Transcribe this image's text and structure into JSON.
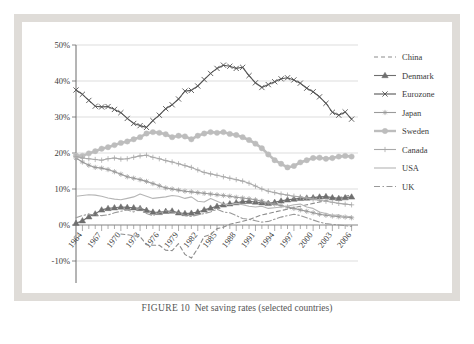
{
  "caption": {
    "label": "FIGURE",
    "number": "10",
    "text": "Net saving rates (selected countries)"
  },
  "chart_data": {
    "type": "line",
    "title": "",
    "xlabel": "",
    "ylabel": "",
    "ylim": [
      -10,
      50
    ],
    "yticks": [
      -10,
      0,
      10,
      20,
      30,
      40,
      50
    ],
    "ytick_labels": [
      "-10%",
      "0%",
      "10%",
      "20%",
      "30%",
      "40%",
      "50%"
    ],
    "xlim": [
      1963,
      2007
    ],
    "xticks": [
      1964,
      1967,
      1970,
      1973,
      1976,
      1979,
      1982,
      1985,
      1988,
      1991,
      1994,
      1997,
      2000,
      2003,
      2006
    ],
    "xtick_labels": [
      "1964",
      "1967",
      "1970",
      "1973",
      "1976",
      "1979",
      "1982",
      "1985",
      "1988",
      "1991",
      "1994",
      "1997",
      "2000",
      "2003",
      "2006"
    ],
    "grid": true,
    "legend_position": "right",
    "x": [
      1963,
      1964,
      1965,
      1966,
      1967,
      1968,
      1969,
      1970,
      1971,
      1972,
      1973,
      1974,
      1975,
      1976,
      1977,
      1978,
      1979,
      1980,
      1981,
      1982,
      1983,
      1984,
      1985,
      1986,
      1987,
      1988,
      1989,
      1990,
      1991,
      1992,
      1993,
      1994,
      1995,
      1996,
      1997,
      1998,
      1999,
      2000,
      2001,
      2002,
      2003,
      2004,
      2005,
      2006
    ],
    "series": [
      {
        "name": "China",
        "color": "#8c8c8c",
        "style": "dashed",
        "marker": "none",
        "values": [
          null,
          null,
          null,
          null,
          null,
          null,
          null,
          -2.5,
          -2.7,
          -3.0,
          -3.2,
          -5.5,
          -5.6,
          -5.6,
          -7.0,
          -7.1,
          -5.2,
          -8.2,
          -9.2,
          -6.5,
          -3.2,
          -2.6,
          -1.0,
          -0.6,
          0.2,
          0.6,
          1.0,
          1.5,
          2.2,
          2.8,
          3.2,
          3.6,
          4.0,
          4.4,
          4.8,
          5.2,
          5.6,
          6.0,
          6.4,
          6.8,
          7.2,
          7.6,
          8.0,
          8.4
        ]
      },
      {
        "name": "Denmark",
        "color": "#6f6f6f",
        "style": "solid",
        "marker": "triangle",
        "values": [
          0.5,
          1.2,
          2.3,
          3.1,
          4.2,
          4.6,
          4.8,
          5.0,
          4.9,
          4.8,
          4.6,
          4.1,
          3.6,
          3.5,
          3.8,
          3.9,
          3.4,
          3.2,
          3.3,
          3.6,
          4.2,
          4.7,
          5.2,
          5.6,
          5.9,
          6.2,
          6.5,
          6.6,
          6.4,
          6.2,
          6.0,
          6.3,
          6.7,
          7.0,
          7.2,
          7.4,
          7.5,
          7.6,
          7.8,
          7.9,
          7.6,
          7.4,
          7.6,
          7.8
        ]
      },
      {
        "name": "Eurozone",
        "color": "#555555",
        "style": "solid",
        "marker": "x",
        "values": [
          37.5,
          36.3,
          34.6,
          33.0,
          32.8,
          32.9,
          32.1,
          31.2,
          29.6,
          28.2,
          27.6,
          27.1,
          29.0,
          30.5,
          32.3,
          33.4,
          35.0,
          37.2,
          37.4,
          38.6,
          40.4,
          42.1,
          43.5,
          44.4,
          44.1,
          43.5,
          43.8,
          41.5,
          39.5,
          38.2,
          39.0,
          39.8,
          40.6,
          40.9,
          40.3,
          39.4,
          38.0,
          37.0,
          35.6,
          33.8,
          31.3,
          30.5,
          31.4,
          29.4
        ]
      },
      {
        "name": "Japan",
        "color": "#9a9a9a",
        "style": "solid",
        "marker": "star",
        "values": [
          18.6,
          17.5,
          16.6,
          16.0,
          15.8,
          15.4,
          14.8,
          14.1,
          13.4,
          13.0,
          12.6,
          12.1,
          11.5,
          10.9,
          10.3,
          10.0,
          9.7,
          9.4,
          9.2,
          9.0,
          8.8,
          8.6,
          8.4,
          8.2,
          8.0,
          7.7,
          7.5,
          7.3,
          7.0,
          6.6,
          6.2,
          5.8,
          5.4,
          5.0,
          4.6,
          4.2,
          3.8,
          3.4,
          3.0,
          2.7,
          2.5,
          2.3,
          2.2,
          2.0
        ]
      },
      {
        "name": "Sweden",
        "color": "#bdbdbd",
        "style": "solid",
        "marker": "circle",
        "values": [
          19.3,
          19.2,
          19.9,
          20.5,
          21.2,
          21.6,
          22.2,
          22.8,
          23.2,
          23.8,
          24.4,
          25.4,
          25.8,
          25.6,
          25.2,
          24.4,
          24.8,
          24.6,
          23.8,
          24.8,
          25.4,
          25.8,
          25.6,
          25.8,
          25.3,
          25.0,
          24.4,
          23.6,
          22.6,
          21.3,
          19.6,
          18.0,
          17.0,
          16.0,
          16.4,
          17.4,
          18.0,
          18.6,
          18.7,
          18.4,
          18.6,
          19.0,
          19.2,
          19.0
        ]
      },
      {
        "name": "Canada",
        "color": "#a9a9a9",
        "style": "solid",
        "marker": "plus",
        "values": [
          19.0,
          18.6,
          18.4,
          18.2,
          18.0,
          18.4,
          18.6,
          18.3,
          18.4,
          18.8,
          19.2,
          19.4,
          18.8,
          18.4,
          17.9,
          17.5,
          17.0,
          16.5,
          16.0,
          15.3,
          14.6,
          14.2,
          13.8,
          13.4,
          13.0,
          12.6,
          12.2,
          11.6,
          10.8,
          10.0,
          9.4,
          9.0,
          8.6,
          8.3,
          8.0,
          7.8,
          7.5,
          7.2,
          6.9,
          6.6,
          6.3,
          6.0,
          5.8,
          5.6
        ]
      },
      {
        "name": "USA",
        "color": "#b5b5b5",
        "style": "solid",
        "marker": "none",
        "values": [
          8.0,
          8.2,
          8.4,
          8.3,
          8.0,
          7.5,
          7.2,
          7.0,
          7.4,
          7.8,
          8.6,
          8.0,
          7.4,
          7.6,
          7.8,
          8.2,
          8.0,
          7.4,
          7.8,
          6.6,
          6.4,
          7.4,
          6.6,
          5.8,
          5.6,
          6.0,
          5.6,
          5.2,
          5.0,
          5.2,
          4.6,
          4.8,
          5.0,
          5.2,
          5.6,
          5.8,
          5.0,
          4.6,
          3.6,
          3.2,
          2.6,
          2.8,
          2.2,
          2.4
        ]
      },
      {
        "name": "UK",
        "color": "#999999",
        "style": "dashdot",
        "marker": "none",
        "values": [
          2.0,
          2.6,
          3.0,
          2.8,
          2.6,
          2.8,
          3.4,
          3.8,
          4.2,
          3.6,
          4.8,
          3.2,
          2.6,
          3.4,
          4.0,
          3.6,
          3.4,
          2.6,
          2.4,
          2.8,
          3.2,
          3.6,
          4.4,
          3.6,
          3.4,
          2.6,
          1.8,
          1.6,
          1.2,
          0.8,
          1.0,
          1.6,
          2.2,
          2.6,
          3.0,
          2.6,
          2.0,
          1.4,
          0.8,
          0.4,
          0.2,
          0.0,
          -0.2,
          -0.4
        ]
      }
    ]
  }
}
